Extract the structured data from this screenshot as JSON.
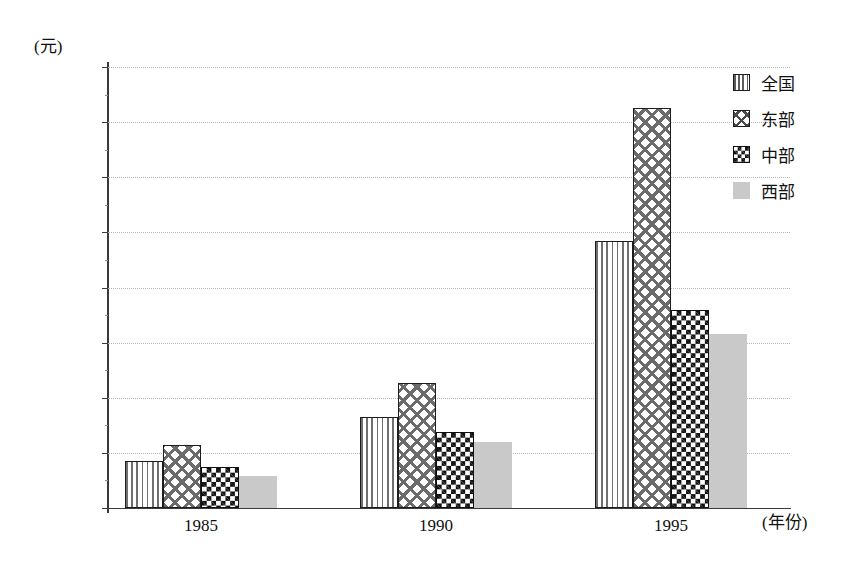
{
  "chart_data": {
    "type": "bar",
    "title": "",
    "subtitle": "",
    "xlabel": "(年份)",
    "ylabel": "(元)",
    "categories": [
      "1985",
      "1990",
      "1995"
    ],
    "series": [
      {
        "name": "全国",
        "pattern": "vertical-stripes",
        "color": "#6f6f6f",
        "values": [
          850,
          1660,
          4840
        ]
      },
      {
        "name": "东部",
        "pattern": "diagonal-crosshatch",
        "color": "#6b6b6b",
        "values": [
          1150,
          2270,
          7250
        ]
      },
      {
        "name": "中部",
        "pattern": "checkerboard",
        "color": "#101010",
        "values": [
          740,
          1370,
          3590
        ]
      },
      {
        "name": "西部",
        "pattern": "solid-gray",
        "color": "#c9c9c9",
        "values": [
          580,
          1190,
          3150
        ]
      }
    ],
    "ylim": [
      0,
      8000
    ],
    "yticks": [
      0,
      1000,
      2000,
      3000,
      4000,
      5000,
      6000,
      7000,
      8000
    ],
    "ytick_labels": [
      "0",
      "1000",
      "2000",
      "3000",
      "4000",
      "5000",
      "6000",
      "7000",
      "8000"
    ],
    "grid": true,
    "grid_axis": "y",
    "legend_position": "right-top"
  },
  "axes": {
    "y_unit_label": "(元)",
    "x_unit_label": "(年份)"
  },
  "legend": {
    "items": [
      {
        "label": "全国"
      },
      {
        "label": "东部"
      },
      {
        "label": "中部"
      },
      {
        "label": "西部"
      }
    ]
  }
}
